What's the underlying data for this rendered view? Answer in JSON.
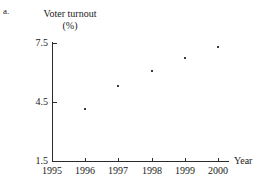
{
  "page": {
    "clipped_header_text": "Solution",
    "part_label": "a."
  },
  "chart_data": {
    "type": "scatter",
    "title": "Voter turnout",
    "title_line2": "(%)",
    "xlabel": "Year",
    "ylabel": "Voter turnout (%)",
    "grid": false,
    "legend": "none",
    "categories": [
      1995,
      1996,
      1997,
      1998,
      1999,
      2000
    ],
    "x_tick_labels": [
      "1995",
      "1996",
      "1997",
      "1998",
      "1999",
      "2000"
    ],
    "y_tick_labels": [
      "1.5",
      "4.5",
      "7.5"
    ],
    "y_ticks": [
      1.5,
      4.5,
      7.5
    ],
    "xlim": [
      1995,
      2000
    ],
    "ylim": [
      1.5,
      7.5
    ],
    "axis_name_x": "Year",
    "points": [
      {
        "x": 1996,
        "y": 4.15
      },
      {
        "x": 1997,
        "y": 5.3
      },
      {
        "x": 1998,
        "y": 6.1
      },
      {
        "x": 1999,
        "y": 6.75
      },
      {
        "x": 2000,
        "y": 7.3
      }
    ],
    "values": [
      null,
      4.15,
      5.3,
      6.1,
      6.75,
      7.3
    ],
    "colors": {
      "axis": "#2b2b2b",
      "marker": "#3a3a3a",
      "text": "#1a1a1a",
      "background": "#ffffff"
    }
  }
}
